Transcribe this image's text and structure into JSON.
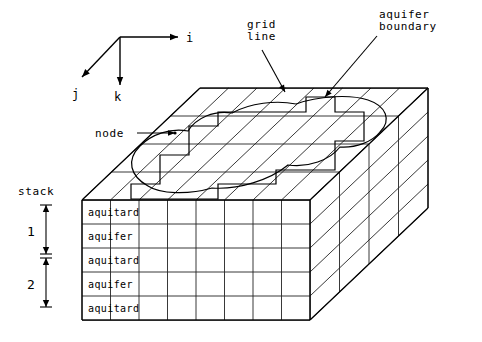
{
  "figure": {
    "background_color": "#ffffff",
    "line_color": "#000000"
  },
  "axes": {
    "origin": {
      "x": 120,
      "y": 37
    },
    "items": [
      {
        "name": "i",
        "label": "i",
        "direction": "right",
        "tip": {
          "x": 178,
          "y": 37
        },
        "label_pos": {
          "x": 186,
          "y": 42
        }
      },
      {
        "name": "j",
        "label": "j",
        "direction": "down-left",
        "tip": {
          "x": 82,
          "y": 77
        },
        "label_pos": {
          "x": 72,
          "y": 98
        }
      },
      {
        "name": "k",
        "label": "k",
        "direction": "down",
        "tip": {
          "x": 120,
          "y": 85
        },
        "label_pos": {
          "x": 114,
          "y": 101
        }
      }
    ]
  },
  "annotations": [
    {
      "id": "grid-line",
      "label": "grid\nline",
      "lines": [
        "grid",
        "line"
      ],
      "text_pos": {
        "x": 247,
        "y": 28
      },
      "leader": [
        {
          "x": 262,
          "y": 50
        },
        {
          "x": 285,
          "y": 92
        }
      ]
    },
    {
      "id": "aquifer-boundary",
      "label": "aquifer\nboundary",
      "lines": [
        "aquifer",
        "boundary"
      ],
      "text_pos": {
        "x": 379,
        "y": 18
      },
      "leader": [
        {
          "x": 377,
          "y": 36
        },
        {
          "x": 325,
          "y": 97
        }
      ]
    },
    {
      "id": "node",
      "label": "node",
      "lines": [
        "node"
      ],
      "text_pos": {
        "x": 95,
        "y": 137
      },
      "leader": [
        {
          "x": 137,
          "y": 133
        },
        {
          "x": 175,
          "y": 133
        }
      ]
    }
  ],
  "stack_bracket": {
    "title": "stack",
    "title_pos": {
      "x": 18,
      "y": 195
    },
    "x": 46,
    "segments": [
      {
        "label": "1",
        "top": 205,
        "bottom": 254,
        "label_pos": {
          "x": 27,
          "y": 236
        }
      },
      {
        "label": "2",
        "top": 258,
        "bottom": 307,
        "label_pos": {
          "x": 27,
          "y": 289
        }
      }
    ]
  },
  "block": {
    "front_face": {
      "left": 82,
      "right": 310,
      "top": 200,
      "bottom": 320,
      "columns": 8,
      "rows": 5
    },
    "depth_vector": {
      "dx": 118,
      "dy": -112
    },
    "depth_divisions": 4,
    "top_face": {
      "front_left": {
        "x": 82,
        "y": 200
      },
      "front_right": {
        "x": 310,
        "y": 200
      },
      "back_right": {
        "x": 428,
        "y": 88
      },
      "back_left": {
        "x": 200,
        "y": 88
      }
    }
  },
  "layers": [
    {
      "index": 0,
      "name": "aquitard",
      "label": "aquitard"
    },
    {
      "index": 1,
      "name": "aquifer",
      "label": "aquifer"
    },
    {
      "index": 2,
      "name": "aquitard",
      "label": "aquitard"
    },
    {
      "index": 3,
      "name": "aquifer",
      "label": "aquifer"
    },
    {
      "index": 4,
      "name": "aquitard",
      "label": "aquitard"
    }
  ],
  "aquifer_boundary_curve": {
    "description": "smooth closed curve on top face enclosing the active aquifer region",
    "path": "M 148 186 C 130 176, 126 160, 140 146 C 152 134, 170 128, 188 131 C 196 118, 214 110, 232 113 C 250 103, 276 100, 296 104 C 318 96, 350 94, 368 100 C 386 106, 392 120, 380 132 C 372 142, 356 148, 340 147 C 330 160, 308 168, 288 165 C 270 180, 238 190, 212 188 C 188 195, 160 194, 148 186 Z"
  },
  "stepped_boundary": {
    "description": "staircase approximation of the aquifer boundary following cell edges",
    "path": "M 131 184 L 160 184 L 160 155 L 189 155 L 189 126 L 218 126 L 218 112 L 306 112 L 306 97 L 335 97 L 335 112 L 364 112 L 364 141 L 335 141 L 335 170 L 276 170 L 276 184 L 218 184 L 218 199 L 131 199 Z"
  },
  "colors": {
    "ink": "#000000",
    "grid": "#222222",
    "paper": "#ffffff"
  }
}
